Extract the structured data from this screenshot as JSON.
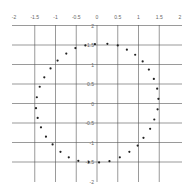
{
  "chart_data": {
    "type": "scatter",
    "title": "",
    "xlabel": "",
    "ylabel": "",
    "xlim": [
      -2,
      2
    ],
    "ylim": [
      -2,
      2
    ],
    "grid": true,
    "legend": null,
    "x_ticks": [
      "-2",
      "-1.5",
      "-1",
      "-0.5",
      "0",
      "0.5",
      "1",
      "1.5",
      "2"
    ],
    "y_ticks": [
      "2",
      "1.5",
      "1",
      "0.5",
      "0",
      "-0.5",
      "-1",
      "-1.5",
      "-2"
    ],
    "series": [
      {
        "name": "points",
        "color": "#222222",
        "points": [
          [
            -0.05,
            1.52
          ],
          [
            0.25,
            1.53
          ],
          [
            0.5,
            1.49
          ],
          [
            0.72,
            1.38
          ],
          [
            0.92,
            1.25
          ],
          [
            1.1,
            1.08
          ],
          [
            1.25,
            0.87
          ],
          [
            1.37,
            0.63
          ],
          [
            1.45,
            0.38
          ],
          [
            1.48,
            0.12
          ],
          [
            1.46,
            -0.15
          ],
          [
            1.38,
            -0.41
          ],
          [
            1.28,
            -0.65
          ],
          [
            1.12,
            -0.88
          ],
          [
            0.98,
            -1.08
          ],
          [
            0.78,
            -1.24
          ],
          [
            0.55,
            -1.38
          ],
          [
            0.3,
            -1.48
          ],
          [
            0.05,
            -1.51
          ],
          [
            -0.2,
            -1.5
          ],
          [
            -0.45,
            -1.47
          ],
          [
            -0.68,
            -1.38
          ],
          [
            -0.88,
            -1.24
          ],
          [
            -1.07,
            -1.05
          ],
          [
            -1.23,
            -0.85
          ],
          [
            -1.35,
            -0.61
          ],
          [
            -1.43,
            -0.37
          ],
          [
            -1.47,
            -0.12
          ],
          [
            -1.45,
            0.16
          ],
          [
            -1.38,
            0.43
          ],
          [
            -1.27,
            0.67
          ],
          [
            -1.12,
            0.9
          ],
          [
            -0.95,
            1.1
          ],
          [
            -0.74,
            1.28
          ],
          [
            -0.52,
            1.42
          ],
          [
            -0.28,
            1.49
          ]
        ]
      }
    ]
  }
}
